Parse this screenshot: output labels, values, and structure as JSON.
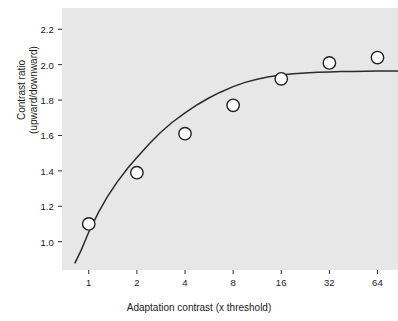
{
  "chart_data": {
    "type": "scatter",
    "title": "",
    "xlabel": "Adaptation contrast (x threshold)",
    "ylabel_line1": "Contrast ratio",
    "ylabel_line2": "(upward/downward)",
    "x_scale": "log2",
    "x_ticks": [
      1,
      2,
      4,
      8,
      16,
      32,
      64
    ],
    "x_tick_labels": [
      "1",
      "2",
      "4",
      "8",
      "16",
      "32",
      "64"
    ],
    "xlim": [
      0.68,
      86
    ],
    "y_ticks": [
      1.0,
      1.2,
      1.4,
      1.6,
      1.8,
      2.0,
      2.2
    ],
    "y_tick_labels": [
      "1.0",
      "1.2",
      "1.4",
      "1.6",
      "1.8",
      "2.0",
      "2.2"
    ],
    "ylim": [
      0.84,
      2.32
    ],
    "grid": false,
    "legend": "none",
    "marker": "open-circle",
    "marker_facecolor": "#ffffff",
    "marker_edgecolor": "#222222",
    "plot_background": "#e7e7e7",
    "curve_color": "#2b2b2b",
    "x": [
      1,
      2,
      4,
      8,
      16,
      32,
      64
    ],
    "values": [
      1.1,
      1.39,
      1.61,
      1.77,
      1.92,
      2.01,
      2.04
    ],
    "series": [
      {
        "name": "Contrast ratio (upward/downward)",
        "x": [
          1,
          2,
          4,
          8,
          16,
          32,
          64
        ],
        "values": [
          1.1,
          1.39,
          1.61,
          1.77,
          1.92,
          2.01,
          2.04
        ]
      }
    ],
    "fit_curve": {
      "name": "saturating fit",
      "x": [
        0.82,
        0.9,
        1.0,
        1.15,
        1.3,
        1.5,
        1.75,
        2.0,
        2.4,
        2.8,
        3.3,
        4.0,
        4.8,
        5.6,
        6.6,
        8.0,
        9.5,
        11.3,
        13.4,
        16.0,
        19.0,
        22.6,
        27.0,
        32.0,
        38.0,
        45.0,
        54.0,
        64.0,
        76.0,
        86.0
      ],
      "values": [
        0.88,
        0.955,
        1.055,
        1.165,
        1.25,
        1.335,
        1.415,
        1.475,
        1.555,
        1.615,
        1.672,
        1.728,
        1.775,
        1.81,
        1.843,
        1.876,
        1.9,
        1.918,
        1.931,
        1.941,
        1.948,
        1.953,
        1.957,
        1.959,
        1.961,
        1.962,
        1.963,
        1.964,
        1.964,
        1.964
      ]
    }
  }
}
